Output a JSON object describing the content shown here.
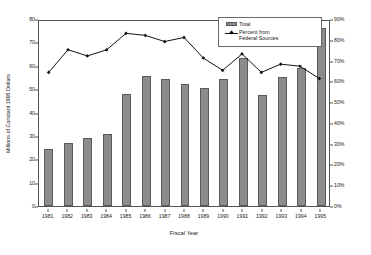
{
  "chart_data": {
    "type": "bar",
    "title": "",
    "subtitle": "",
    "xlabel": "Fiscal Year",
    "ylabel": "Millions of Constant 1995 Dollars",
    "ylabel_secondary": "",
    "categories": [
      "1981",
      "1982",
      "1983",
      "1984",
      "1985",
      "1986",
      "1987",
      "1988",
      "1989",
      "1990",
      "1991",
      "1992",
      "1993",
      "1994",
      "1995"
    ],
    "ylim": [
      0,
      80
    ],
    "ylim_secondary": [
      0,
      0.9
    ],
    "yticks": [
      0,
      10,
      20,
      30,
      40,
      50,
      60,
      70,
      80
    ],
    "ytick_labels": [
      "0",
      "10",
      "20",
      "30",
      "40",
      "50",
      "60",
      "70",
      "80"
    ],
    "yticks_secondary": [
      0,
      10,
      20,
      30,
      40,
      50,
      60,
      70,
      80,
      90
    ],
    "ytick_labels_secondary": [
      "0%",
      "10%",
      "20%",
      "30%",
      "40%",
      "50%",
      "60%",
      "70%",
      "80%",
      "90%"
    ],
    "grid": false,
    "legend_position": "top-right",
    "series": [
      {
        "name": "Total",
        "type": "bar",
        "axis": "left",
        "color": "#8c8c8c",
        "values": [
          24.5,
          26.8,
          29.0,
          31.0,
          47.8,
          55.7,
          54.2,
          52.3,
          50.5,
          54.2,
          63.4,
          47.5,
          55.0,
          59.0,
          76.2
        ]
      },
      {
        "name": "Percent from Federal Sources",
        "type": "line",
        "axis": "right",
        "color": "#111111",
        "marker": "diamond",
        "values": [
          65,
          76,
          73,
          76,
          84,
          83,
          80,
          82,
          72,
          66,
          74,
          65,
          69,
          68,
          62
        ]
      }
    ]
  },
  "legend": {
    "entries": [
      {
        "label": "Total",
        "swatch": "bar-swatch"
      },
      {
        "label": "Percent from\nFederal Sources",
        "swatch": "line-marker-swatch"
      }
    ]
  },
  "axes": {
    "x_title": "Fiscal Year",
    "y_title": "Millions of Constant 1995 Dollars"
  }
}
